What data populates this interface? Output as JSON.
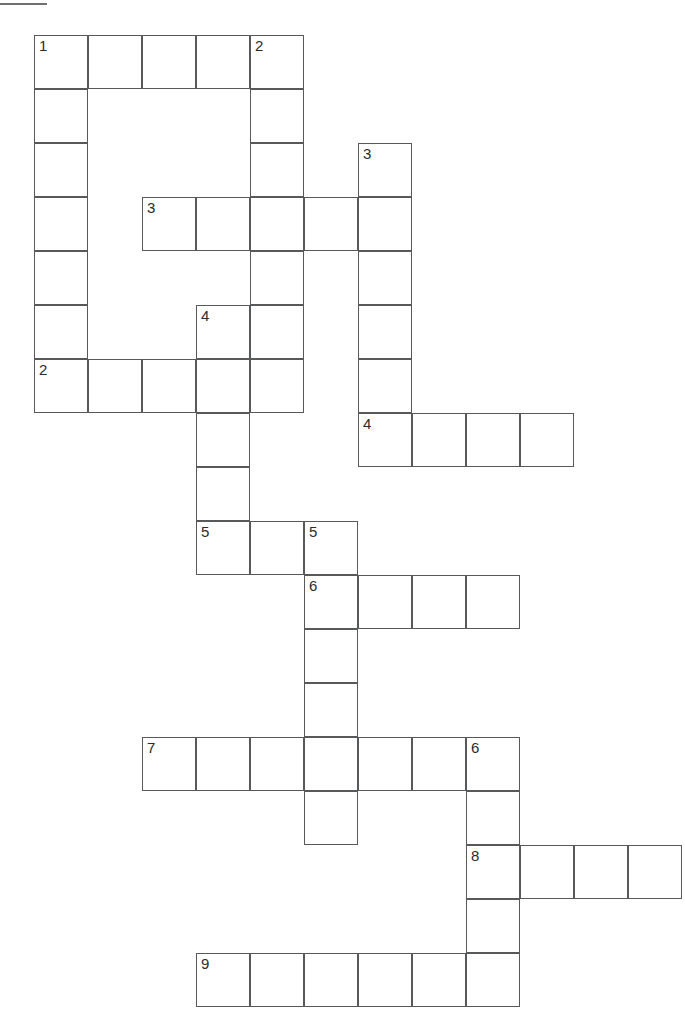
{
  "page": {
    "background_color": "#ffffff",
    "grid_line_color": "#58595b",
    "number_color": "#2b2b2b",
    "cell_size_px": 54,
    "origin_x_px": 34,
    "origin_y_px": 35,
    "width_px": 685,
    "height_px": 1028
  },
  "decorations": [
    {
      "name": "top-left-rule-upper",
      "x": 0,
      "y": 3,
      "width": 47,
      "height": 2
    },
    {
      "name": "top-left-rule-lower",
      "x": 40,
      "y": 35,
      "width": 44,
      "height": 2
    }
  ],
  "entries": [
    {
      "number": "1",
      "direction": "down",
      "col": 0,
      "row": 0,
      "length": 7
    },
    {
      "number": "1",
      "direction": "across",
      "col": 0,
      "row": 0,
      "length": 5
    },
    {
      "number": "2",
      "direction": "down",
      "col": 4,
      "row": 0,
      "length": 5
    },
    {
      "number": "3",
      "direction": "down",
      "col": 6,
      "row": 2,
      "length": 6
    },
    {
      "number": "3",
      "direction": "across",
      "col": 2,
      "row": 3,
      "length": 5
    },
    {
      "number": "4",
      "direction": "down",
      "col": 3,
      "row": 5,
      "length": 5
    },
    {
      "number": "2",
      "direction": "across",
      "col": 0,
      "row": 6,
      "length": 5
    },
    {
      "number": "4",
      "direction": "across",
      "col": 6,
      "row": 7,
      "length": 4
    },
    {
      "number": "5",
      "direction": "across",
      "col": 3,
      "row": 9,
      "length": 3
    },
    {
      "number": "5",
      "direction": "down",
      "col": 5,
      "row": 9,
      "length": 6
    },
    {
      "number": "6",
      "direction": "across",
      "col": 5,
      "row": 10,
      "length": 4
    },
    {
      "number": "7",
      "direction": "across",
      "col": 2,
      "row": 13,
      "length": 7
    },
    {
      "number": "6",
      "direction": "down",
      "col": 8,
      "row": 13,
      "length": 5
    },
    {
      "number": "8",
      "direction": "across",
      "col": 8,
      "row": 15,
      "length": 4
    },
    {
      "number": "9",
      "direction": "across",
      "col": 3,
      "row": 17,
      "length": 6
    }
  ],
  "cells": [
    {
      "col": 0,
      "row": 0,
      "number": "1"
    },
    {
      "col": 1,
      "row": 0,
      "number": ""
    },
    {
      "col": 2,
      "row": 0,
      "number": ""
    },
    {
      "col": 3,
      "row": 0,
      "number": ""
    },
    {
      "col": 4,
      "row": 0,
      "number": "2"
    },
    {
      "col": 0,
      "row": 1,
      "number": ""
    },
    {
      "col": 4,
      "row": 1,
      "number": ""
    },
    {
      "col": 0,
      "row": 2,
      "number": ""
    },
    {
      "col": 4,
      "row": 2,
      "number": ""
    },
    {
      "col": 6,
      "row": 2,
      "number": "3"
    },
    {
      "col": 0,
      "row": 3,
      "number": ""
    },
    {
      "col": 2,
      "row": 3,
      "number": "3"
    },
    {
      "col": 3,
      "row": 3,
      "number": ""
    },
    {
      "col": 4,
      "row": 3,
      "number": ""
    },
    {
      "col": 5,
      "row": 3,
      "number": ""
    },
    {
      "col": 6,
      "row": 3,
      "number": ""
    },
    {
      "col": 0,
      "row": 4,
      "number": ""
    },
    {
      "col": 4,
      "row": 4,
      "number": ""
    },
    {
      "col": 6,
      "row": 4,
      "number": ""
    },
    {
      "col": 0,
      "row": 5,
      "number": ""
    },
    {
      "col": 3,
      "row": 5,
      "number": "4"
    },
    {
      "col": 4,
      "row": 5,
      "number": ""
    },
    {
      "col": 6,
      "row": 5,
      "number": ""
    },
    {
      "col": 0,
      "row": 6,
      "number": "2"
    },
    {
      "col": 1,
      "row": 6,
      "number": ""
    },
    {
      "col": 2,
      "row": 6,
      "number": ""
    },
    {
      "col": 3,
      "row": 6,
      "number": ""
    },
    {
      "col": 4,
      "row": 6,
      "number": ""
    },
    {
      "col": 6,
      "row": 6,
      "number": ""
    },
    {
      "col": 3,
      "row": 7,
      "number": ""
    },
    {
      "col": 6,
      "row": 7,
      "number": "4"
    },
    {
      "col": 7,
      "row": 7,
      "number": ""
    },
    {
      "col": 8,
      "row": 7,
      "number": ""
    },
    {
      "col": 9,
      "row": 7,
      "number": ""
    },
    {
      "col": 3,
      "row": 8,
      "number": ""
    },
    {
      "col": 3,
      "row": 9,
      "number": "5"
    },
    {
      "col": 4,
      "row": 9,
      "number": ""
    },
    {
      "col": 5,
      "row": 9,
      "number": "5"
    },
    {
      "col": 5,
      "row": 10,
      "number": "6"
    },
    {
      "col": 6,
      "row": 10,
      "number": ""
    },
    {
      "col": 7,
      "row": 10,
      "number": ""
    },
    {
      "col": 8,
      "row": 10,
      "number": ""
    },
    {
      "col": 5,
      "row": 11,
      "number": ""
    },
    {
      "col": 5,
      "row": 12,
      "number": ""
    },
    {
      "col": 2,
      "row": 13,
      "number": "7"
    },
    {
      "col": 3,
      "row": 13,
      "number": ""
    },
    {
      "col": 4,
      "row": 13,
      "number": ""
    },
    {
      "col": 5,
      "row": 13,
      "number": ""
    },
    {
      "col": 6,
      "row": 13,
      "number": ""
    },
    {
      "col": 7,
      "row": 13,
      "number": ""
    },
    {
      "col": 8,
      "row": 13,
      "number": "6"
    },
    {
      "col": 5,
      "row": 14,
      "number": ""
    },
    {
      "col": 8,
      "row": 14,
      "number": ""
    },
    {
      "col": 8,
      "row": 15,
      "number": "8"
    },
    {
      "col": 9,
      "row": 15,
      "number": ""
    },
    {
      "col": 10,
      "row": 15,
      "number": ""
    },
    {
      "col": 11,
      "row": 15,
      "number": ""
    },
    {
      "col": 8,
      "row": 16,
      "number": ""
    },
    {
      "col": 3,
      "row": 17,
      "number": "9"
    },
    {
      "col": 4,
      "row": 17,
      "number": ""
    },
    {
      "col": 5,
      "row": 17,
      "number": ""
    },
    {
      "col": 6,
      "row": 17,
      "number": ""
    },
    {
      "col": 7,
      "row": 17,
      "number": ""
    },
    {
      "col": 8,
      "row": 17,
      "number": ""
    }
  ]
}
